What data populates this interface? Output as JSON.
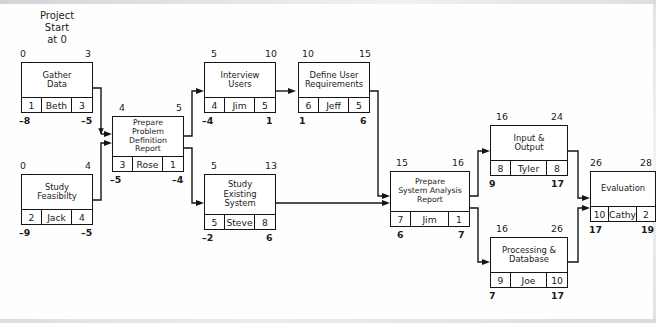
{
  "figure": {
    "caption": "Project\nStart\nat 0"
  },
  "node_legend": {
    "top_left": "early start",
    "top_right": "early finish",
    "bottom_left": "late start",
    "bottom_right": "late finish",
    "strip_left": "duration",
    "strip_middle": "resource",
    "strip_right": "slack"
  },
  "nodes": [
    {
      "id": "gather-data",
      "name": "Gather\nData",
      "top_left": "0",
      "top_right": "3",
      "strip": {
        "left": "1",
        "middle": "Beth",
        "right": "3"
      },
      "bottom_left": "–8",
      "bottom_right": "–5"
    },
    {
      "id": "study-feasibility",
      "name": "Study\nFeasibilty",
      "top_left": "0",
      "top_right": "4",
      "strip": {
        "left": "2",
        "middle": "Jack",
        "right": "4"
      },
      "bottom_left": "–9",
      "bottom_right": "–5"
    },
    {
      "id": "prepare-problem-definition-report",
      "name": "Prepare\nProblem Definition\nReport",
      "top_left": "4",
      "top_right": "5",
      "strip": {
        "left": "3",
        "middle": "Rose",
        "right": "1"
      },
      "bottom_left": "–5",
      "bottom_right": "–4"
    },
    {
      "id": "interview-users",
      "name": "Interview\nUsers",
      "top_left": "5",
      "top_right": "10",
      "strip": {
        "left": "4",
        "middle": "Jim",
        "right": "5"
      },
      "bottom_left": "–4",
      "bottom_right": "1"
    },
    {
      "id": "define-user-requirements",
      "name": "Define User\nRequirements",
      "top_left": "10",
      "top_right": "15",
      "strip": {
        "left": "6",
        "middle": "Jeff",
        "right": "5"
      },
      "bottom_left": "1",
      "bottom_right": "6"
    },
    {
      "id": "study-existing-system",
      "name": "Study\nExisting\nSystem",
      "top_left": "5",
      "top_right": "13",
      "strip": {
        "left": "5",
        "middle": "Steve",
        "right": "8"
      },
      "bottom_left": "–2",
      "bottom_right": "6"
    },
    {
      "id": "prepare-system-analysis-report",
      "name": "Prepare\nSystem Analysis\nReport",
      "top_left": "15",
      "top_right": "16",
      "strip": {
        "left": "7",
        "middle": "Jim",
        "right": "1"
      },
      "bottom_left": "6",
      "bottom_right": "7"
    },
    {
      "id": "input-output",
      "name": "Input &\nOutput",
      "top_left": "16",
      "top_right": "24",
      "strip": {
        "left": "8",
        "middle": "Tyler",
        "right": "8"
      },
      "bottom_left": "9",
      "bottom_right": "17"
    },
    {
      "id": "processing-database",
      "name": "Processing &\nDatabase",
      "top_left": "16",
      "top_right": "26",
      "strip": {
        "left": "9",
        "middle": "Joe",
        "right": "10"
      },
      "bottom_left": "7",
      "bottom_right": "17"
    },
    {
      "id": "evaluation",
      "name": "Evaluation",
      "top_left": "26",
      "top_right": "28",
      "strip": {
        "left": "10",
        "middle": "Cathy",
        "right": "2"
      },
      "bottom_left": "17",
      "bottom_right": "19"
    }
  ],
  "edges": [
    {
      "from": "gather-data",
      "to": "prepare-problem-definition-report"
    },
    {
      "from": "study-feasibility",
      "to": "prepare-problem-definition-report"
    },
    {
      "from": "prepare-problem-definition-report",
      "to": "interview-users"
    },
    {
      "from": "prepare-problem-definition-report",
      "to": "study-existing-system"
    },
    {
      "from": "interview-users",
      "to": "define-user-requirements"
    },
    {
      "from": "define-user-requirements",
      "to": "prepare-system-analysis-report"
    },
    {
      "from": "study-existing-system",
      "to": "prepare-system-analysis-report"
    },
    {
      "from": "prepare-system-analysis-report",
      "to": "input-output"
    },
    {
      "from": "prepare-system-analysis-report",
      "to": "processing-database"
    },
    {
      "from": "input-output",
      "to": "evaluation"
    },
    {
      "from": "processing-database",
      "to": "evaluation"
    }
  ],
  "colors": {
    "stroke": "#151515",
    "background": "#ffffff"
  }
}
